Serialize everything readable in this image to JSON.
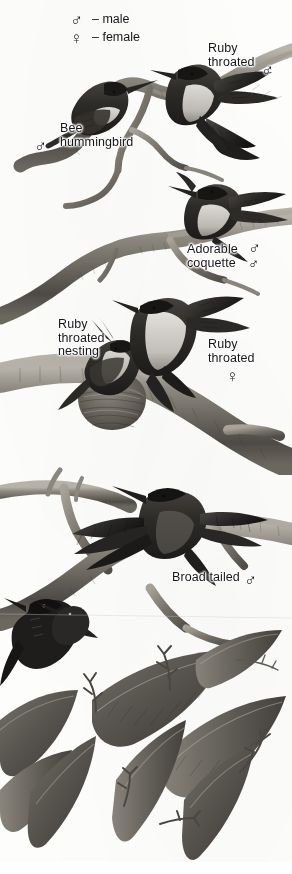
{
  "plate": {
    "title": "Hummingbirds illustration plate",
    "medium": "grayscale-engraving",
    "background_color": "#fdfdfc",
    "ink_color": "#16171a",
    "width": 292,
    "height": 874
  },
  "legend": {
    "name": "sex-symbol-legend",
    "entries": [
      {
        "symbol": "♂",
        "dash": "–",
        "label": "male"
      },
      {
        "symbol": "♀",
        "dash": "–",
        "label": "female"
      }
    ],
    "line_male": "– male",
    "line_female": "– female",
    "male_glyph": "♂",
    "female_glyph": "♀"
  },
  "callouts": [
    {
      "id": "bee-hummingbird",
      "text": "Bee\nhummingbird",
      "sex": "♂",
      "sex_name": "male",
      "x": 60,
      "y": 122,
      "sex_x": 34,
      "sex_y": 138
    },
    {
      "id": "ruby-throated-male",
      "text": "Ruby\nthroated",
      "sex": "♂",
      "sex_name": "male",
      "x": 208,
      "y": 42,
      "sex_x": 261,
      "sex_y": 62
    },
    {
      "id": "adorable-coquette",
      "text": "Adorable\ncoquette",
      "sex": "♂",
      "sex_name": "male",
      "x": 187,
      "y": 243,
      "sex_x": 248,
      "sex_y": 243
    },
    {
      "id": "ruby-throated-nesting",
      "text": "Ruby\nthroated\nnesting",
      "sex": null,
      "sex_name": null,
      "x": 58,
      "y": 318
    },
    {
      "id": "ruby-throated-female",
      "text": "Ruby\nthroated",
      "sex": "♀",
      "sex_name": "female",
      "x": 208,
      "y": 338,
      "sex_x": 226,
      "sex_y": 368
    },
    {
      "id": "broad-tailed",
      "text": "Broad tailed",
      "sex": "♂",
      "sex_name": "male",
      "x": 172,
      "y": 571,
      "sex_x": 244,
      "sex_y": 574
    }
  ],
  "subjects": [
    {
      "name": "bee-hummingbird-perched",
      "species": "Bee hummingbird",
      "sex": "male",
      "pose": "perched-on-branch"
    },
    {
      "name": "ruby-throated-hovering",
      "species": "Ruby throated",
      "sex": "male",
      "pose": "hovering-wings-spread"
    },
    {
      "name": "adorable-coquette-perched",
      "species": "Adorable coquette",
      "sex": "male",
      "pose": "perched"
    },
    {
      "name": "ruby-throated-nest",
      "species": "Ruby throated",
      "sex": "female",
      "pose": "nesting-in-cup-nest"
    },
    {
      "name": "ruby-throated-feeding",
      "species": "Ruby throated",
      "sex": "female",
      "pose": "feeding-chick-wings-back"
    },
    {
      "name": "broad-tailed-perched",
      "species": "Broad tailed",
      "sex": "male",
      "pose": "perched-wings-open"
    },
    {
      "name": "dark-bird-lower-left",
      "species": "unlabeled",
      "sex": "",
      "pose": "perched-lower-left"
    }
  ],
  "foliage": {
    "name": "branch-and-leaf-foliage",
    "elements": [
      "thick-branches",
      "twigs",
      "broad-leaves",
      "bud-clusters"
    ]
  }
}
